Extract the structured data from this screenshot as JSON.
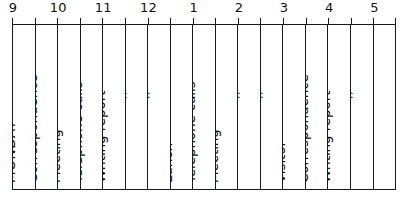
{
  "chart_data": {
    "type": "table",
    "title": "",
    "xlabel": "",
    "ylabel": "",
    "orientation": "horizontal-time-axis",
    "axis": {
      "name": "hours",
      "start": 9,
      "end": 17.5,
      "major_tick_hours": 1,
      "minor_tick_hours": 0.5,
      "tick_labels": [
        "9",
        "10",
        "11",
        "12",
        "1",
        "2",
        "3",
        "4",
        "5"
      ],
      "tick_label_hours": [
        9,
        10,
        11,
        12,
        13,
        14,
        15,
        16,
        17
      ]
    },
    "grid": true,
    "legend": "none",
    "categories": [
      "9:00",
      "9:30",
      "10:00",
      "10:30",
      "11:00",
      "11:30",
      "12:00",
      "12:30",
      "13:00",
      "13:30",
      "14:00",
      "14:30",
      "15:00",
      "15:30",
      "16:00",
      "16:30",
      "17:00"
    ],
    "values": [
      "MONDAY",
      "Correspondence",
      "Meeting",
      "Telephone calls",
      "Writing report",
      "〃",
      "〃",
      "Lunch",
      "Telephone calls",
      "Meeting",
      "〃",
      "〃",
      "Visitor",
      "Correspondence",
      "Writing report",
      "〃",
      ""
    ]
  },
  "hour_scale": {
    "ticks": [
      {
        "label": "9",
        "hour": 9
      },
      {
        "label": "10",
        "hour": 10
      },
      {
        "label": "11",
        "hour": 11
      },
      {
        "label": "12",
        "hour": 12
      },
      {
        "label": "1",
        "hour": 13
      },
      {
        "label": "2",
        "hour": 14
      },
      {
        "label": "3",
        "hour": 15
      },
      {
        "label": "4",
        "hour": 16
      },
      {
        "label": "5",
        "hour": 17
      }
    ]
  },
  "colors": {
    "ink": "#1b1b1b",
    "paper": "#ffffff",
    "text": "#111111"
  },
  "slots": [
    {
      "time": "9:00",
      "label": "MONDAY",
      "style": "day"
    },
    {
      "time": "9:30",
      "label": "Correspondence",
      "style": "wide"
    },
    {
      "time": "10:00",
      "label": "Meeting",
      "style": "wide"
    },
    {
      "time": "10:30",
      "label": "Telephone calls",
      "style": "wide"
    },
    {
      "time": "11:00",
      "label": "Writing report",
      "style": "wide"
    },
    {
      "time": "11:30",
      "label": "〃",
      "style": "ditto"
    },
    {
      "time": "12:00",
      "label": "〃",
      "style": "ditto"
    },
    {
      "time": "12:30",
      "label": "Lunch",
      "style": "wide"
    },
    {
      "time": "13:00",
      "label": "Telephone calls",
      "style": "wide"
    },
    {
      "time": "13:30",
      "label": "Meeting",
      "style": "wide"
    },
    {
      "time": "14:00",
      "label": "〃",
      "style": "ditto"
    },
    {
      "time": "14:30",
      "label": "〃",
      "style": "ditto"
    },
    {
      "time": "15:00",
      "label": "Visitor",
      "style": "wide"
    },
    {
      "time": "15:30",
      "label": "Correspondence",
      "style": "wide"
    },
    {
      "time": "16:00",
      "label": "Writing report",
      "style": "wide"
    },
    {
      "time": "16:30",
      "label": "〃",
      "style": "ditto"
    },
    {
      "time": "17:00",
      "label": "",
      "style": "empty"
    }
  ]
}
